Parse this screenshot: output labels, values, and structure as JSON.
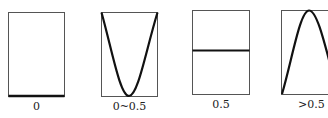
{
  "panels": [
    {
      "label": "0",
      "curve": "flat-bottom"
    },
    {
      "label": "0~0.5",
      "curve": "parabola-min"
    },
    {
      "label": "0.5",
      "curve": "flat-middle"
    },
    {
      "label": ">0.5",
      "curve": "parabola-max"
    }
  ],
  "colors": {
    "frame": "#555555",
    "curve": "#111111",
    "background": "#ffffff"
  }
}
